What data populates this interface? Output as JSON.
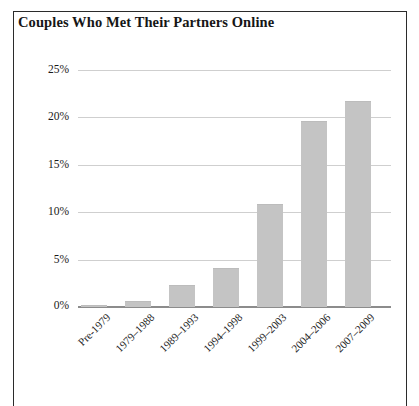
{
  "figure": {
    "title": "Couples Who Met Their Partners Online",
    "frame_color": "#2b2b2b",
    "background": "#ffffff"
  },
  "chart_data": {
    "type": "bar",
    "title": "Couples Who Met Their Partners Online",
    "xlabel": "",
    "ylabel": "",
    "ylim": [
      0,
      25
    ],
    "ytick_labels": [
      "25%",
      "20%",
      "15%",
      "10%",
      "5%",
      "0%"
    ],
    "ytick_values": [
      25,
      20,
      15,
      10,
      5,
      0
    ],
    "grid": true,
    "legend": false,
    "bar_color": "#c4c4c4",
    "categories": [
      "Pre-1979",
      "1979–1988",
      "1989–1993",
      "1994–1998",
      "1999–2003",
      "2004–2006",
      "2007–2009"
    ],
    "values": [
      0.2,
      0.6,
      2.3,
      4.1,
      10.9,
      19.6,
      21.7
    ],
    "value_labels": [
      "0.2%",
      "0.6%",
      "2.3%",
      "4.1%",
      "10.9%",
      "19.6%",
      "21.7%"
    ]
  },
  "caption": {
    "cutoff_text": ""
  }
}
